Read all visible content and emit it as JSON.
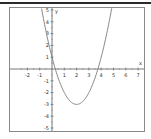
{
  "chart_data": {
    "type": "line",
    "title": "",
    "xlabel": "x",
    "ylabel": "y",
    "xlim": [
      -3,
      7
    ],
    "ylim": [
      -5,
      5
    ],
    "grid": false,
    "legend": null,
    "x_ticks": [
      -2,
      -1,
      1,
      2,
      3,
      4,
      5,
      6,
      7
    ],
    "y_ticks": [
      -5,
      -4,
      -3,
      -2,
      -1,
      1,
      2,
      3,
      4,
      5
    ],
    "series": [
      {
        "name": "parabola",
        "equation": "y = x^2 - 4x + 1",
        "vertex": [
          2,
          -3
        ],
        "roots": [
          0.27,
          3.73
        ],
        "y_intercept": 1,
        "x": [
          -0.9,
          -0.5,
          0,
          0.5,
          1,
          1.5,
          2,
          2.5,
          3,
          3.5,
          4,
          4.5,
          4.9
        ],
        "values": [
          5.41,
          3.25,
          1,
          -0.75,
          -2,
          -2.75,
          -3,
          -2.75,
          -2,
          -0.75,
          1,
          3.25,
          5.41
        ],
        "color": "#888888"
      }
    ]
  },
  "axis": {
    "x_label": "x",
    "y_label": "y",
    "x_tick_labels": [
      "-2",
      "-1",
      "1",
      "2",
      "3",
      "4",
      "5",
      "6",
      "7"
    ],
    "y_tick_labels": [
      "5",
      "4",
      "3",
      "2",
      "1",
      "-1",
      "-2",
      "-3",
      "-4",
      "-5"
    ]
  }
}
